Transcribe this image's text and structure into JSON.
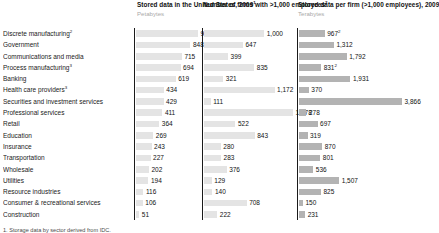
{
  "columns": [
    {
      "id": "stored-data-us",
      "title": "Stored data in the United States, 2009",
      "title_sup": "1",
      "subtitle": "Petabytes"
    },
    {
      "id": "number-of-firms",
      "title": "Number of firms with >1,000 employees",
      "title_sup": "2",
      "subtitle": ""
    },
    {
      "id": "stored-data-per-firm",
      "title": "Stored data per firm (>1,000 employees), 2009",
      "title_sup": "",
      "subtitle": "Terabytes"
    }
  ],
  "footnote": "1. Storage data by sector derived from IDC.",
  "chart_data": {
    "type": "bar",
    "categories": [
      "Discrete manufacturing",
      "Government",
      "Communications and media",
      "Process manufacturing",
      "Banking",
      "Health care providers",
      "Securities and investment services",
      "Professional services",
      "Retail",
      "Education",
      "Insurance",
      "Transportation",
      "Wholesale",
      "Utilities",
      "Resource industries",
      "Consumer & recreational services",
      "Construction"
    ],
    "category_superscripts": [
      "2",
      "",
      "",
      "3",
      "",
      "3",
      "",
      "",
      "",
      "",
      "",
      "",
      "",
      "",
      "",
      "",
      ""
    ],
    "series": [
      {
        "name": "Stored data in the United States, 2009",
        "unit": "Petabytes",
        "xlabel": "",
        "max": 966,
        "values": [
          966,
          848,
          715,
          694,
          619,
          434,
          429,
          411,
          364,
          269,
          243,
          227,
          202,
          194,
          116,
          106,
          51
        ],
        "labels": [
          "966",
          "848",
          "715",
          "694",
          "619",
          "434",
          "429",
          "411",
          "364",
          "269",
          "243",
          "227",
          "202",
          "194",
          "116",
          "106",
          "51"
        ],
        "superscripts": [
          "",
          "",
          "",
          "",
          "",
          "",
          "",
          "",
          "",
          "",
          "",
          "",
          "",
          "",
          "",
          "",
          ""
        ]
      },
      {
        "name": "Number of firms with >1,000 employees",
        "unit": "",
        "xlabel": "",
        "max": 1478,
        "values": [
          1000,
          647,
          399,
          835,
          321,
          1172,
          111,
          1478,
          522,
          843,
          280,
          283,
          376,
          129,
          140,
          708,
          222
        ],
        "labels": [
          "1,000",
          "647",
          "399",
          "835",
          "321",
          "1,172",
          "111",
          "1,478",
          "522",
          "843",
          "280",
          "283",
          "376",
          "129",
          "140",
          "708",
          "222"
        ],
        "superscripts": [
          "",
          "",
          "",
          "",
          "",
          "",
          "",
          "",
          "",
          "",
          "",
          "",
          "",
          "",
          "",
          "",
          ""
        ]
      },
      {
        "name": "Stored data per firm (>1,000 employees), 2009",
        "unit": "Terabytes",
        "xlabel": "",
        "max": 3866,
        "values": [
          967,
          1312,
          1792,
          831,
          1931,
          370,
          3866,
          278,
          697,
          319,
          870,
          801,
          536,
          1507,
          825,
          150,
          231
        ],
        "labels": [
          "967",
          "1,312",
          "1,792",
          "831",
          "1,931",
          "370",
          "3,866",
          "278",
          "697",
          "319",
          "870",
          "801",
          "536",
          "1,507",
          "825",
          "150",
          "231"
        ],
        "superscripts": [
          "2",
          "",
          "",
          "2",
          "",
          "",
          "",
          "",
          "",
          "",
          "",
          "",
          "",
          "",
          "",
          "",
          ""
        ]
      }
    ],
    "colors": {
      "bar_light": "#e4e4e4",
      "bar_dark": "#b3b3b3",
      "axis": "#1a1a1a",
      "text": "#1a1a1a",
      "subtitle": "#a9a9a9"
    },
    "grid": false,
    "legend": "none"
  }
}
